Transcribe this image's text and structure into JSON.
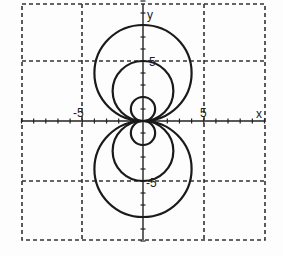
{
  "chart_data": {
    "type": "line",
    "title": "",
    "xlabel": "x",
    "ylabel": "y",
    "xlim": [
      -10,
      10
    ],
    "ylim": [
      -10,
      10
    ],
    "grid": true,
    "grid_step": 5,
    "tick_labels": {
      "x": [
        "-5",
        "5"
      ],
      "y": [
        "5",
        "-5"
      ]
    },
    "series": [
      {
        "name": "circle-large-upper",
        "shape": "circle",
        "center": [
          0,
          4
        ],
        "radius": 4
      },
      {
        "name": "circle-medium-upper",
        "shape": "circle",
        "center": [
          0,
          2.5
        ],
        "radius": 2.5
      },
      {
        "name": "circle-small-upper",
        "shape": "circle",
        "center": [
          0,
          1
        ],
        "radius": 1
      },
      {
        "name": "circle-large-lower",
        "shape": "circle",
        "center": [
          0,
          -4
        ],
        "radius": 4
      },
      {
        "name": "circle-medium-lower",
        "shape": "circle",
        "center": [
          0,
          -2.5
        ],
        "radius": 2.5
      },
      {
        "name": "circle-small-lower",
        "shape": "circle",
        "center": [
          0,
          -1
        ],
        "radius": 1
      }
    ]
  },
  "labels": {
    "x_axis": "x",
    "y_axis": "y",
    "x_neg5": "-5",
    "x_pos5": "5",
    "y_pos5": "5",
    "y_neg5": "-5"
  }
}
